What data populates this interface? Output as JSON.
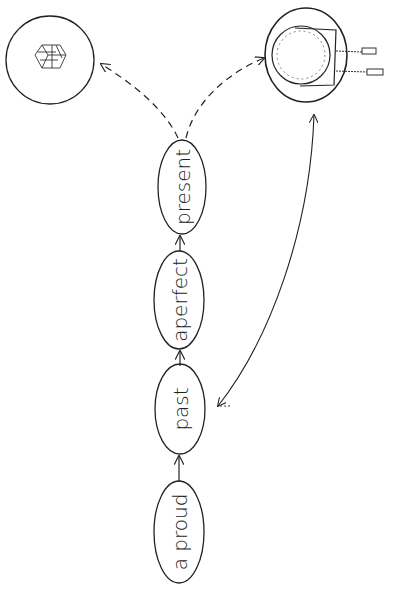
{
  "diagram": {
    "nodes": [
      {
        "id": "a_proud",
        "label": "a proud"
      },
      {
        "id": "past",
        "label": "past"
      },
      {
        "id": "a_perfect",
        "label": "aperfect"
      },
      {
        "id": "present",
        "label": "present"
      }
    ],
    "images": [
      {
        "id": "gift",
        "depicts": "gift box"
      },
      {
        "id": "clock",
        "depicts": "clock"
      }
    ],
    "edges": [
      {
        "from": "a_proud",
        "to": "past",
        "style": "solid"
      },
      {
        "from": "past",
        "to": "a_perfect",
        "style": "solid"
      },
      {
        "from": "a_perfect",
        "to": "present",
        "style": "solid"
      },
      {
        "from": "present",
        "to": "gift",
        "style": "dashed"
      },
      {
        "from": "present",
        "to": "clock",
        "style": "dashed"
      },
      {
        "from": "clock",
        "to": "past",
        "style": "solid",
        "bidirectional": true
      }
    ]
  }
}
